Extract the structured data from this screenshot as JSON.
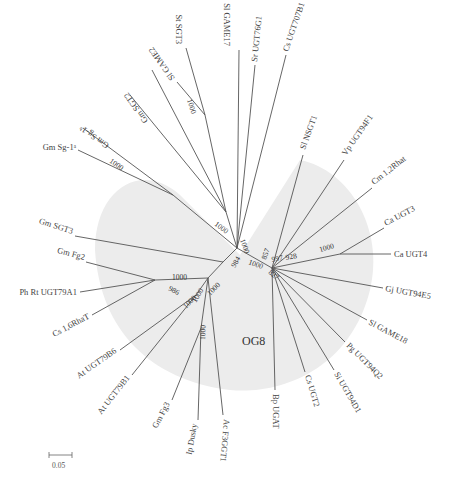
{
  "diagram": {
    "type": "unrooted phylogenetic tree",
    "group": {
      "label": "OG8",
      "shade_color": "#ececec"
    },
    "scale_bar": {
      "label": "0.05"
    },
    "leaves": [
      {
        "id": "sl_game2",
        "label": "Sl GAME2"
      },
      {
        "id": "st_sgt3",
        "label": "St SGT3"
      },
      {
        "id": "sl_game17",
        "label": "Sl GAME17"
      },
      {
        "id": "sr_ugt76g1",
        "label": "Sr UGT76G1"
      },
      {
        "id": "ca_ugt707b1",
        "label": "Cs UGT707B1"
      },
      {
        "id": "gm_sgt2",
        "label": "Gm SGT2"
      },
      {
        "id": "gm_sg1b",
        "label": "Gm Sg-1ᵇ"
      },
      {
        "id": "gm_sg1a",
        "label": "Gm Sg-1ᵃ"
      },
      {
        "id": "sl_nsgt1",
        "label": "Sl NSGT1"
      },
      {
        "id": "vp_ugt94f1",
        "label": "Vp UGT94F1"
      },
      {
        "id": "cm_12rhat",
        "label": "Cm 1,2Rhat"
      },
      {
        "id": "ca_ugt3",
        "label": "Ca UGT3"
      },
      {
        "id": "ca_ugt4",
        "label": "Ca UGT4"
      },
      {
        "id": "gj_ugt94e5",
        "label": "Gj UGT94E5"
      },
      {
        "id": "sl_game18",
        "label": "Sl GAME18"
      },
      {
        "id": "pg_ugt94q2",
        "label": "Pg UGT94Q2"
      },
      {
        "id": "si_ugt94d1",
        "label": "Si UGT94D1"
      },
      {
        "id": "cs_ugt2",
        "label": "Cs UGT2"
      },
      {
        "id": "bp_ugat",
        "label": "Bp UGAT"
      },
      {
        "id": "gm_sgt3",
        "label": "Gm SGT3"
      },
      {
        "id": "gm_fg2",
        "label": "Gm Fg2"
      },
      {
        "id": "ph_rt",
        "label": "Ph Rt UGT79A1"
      },
      {
        "id": "cs_16rhat",
        "label": "Cs 1,6RhaT"
      },
      {
        "id": "at_ugt79b6",
        "label": "At UGT79B6"
      },
      {
        "id": "at_ugt79b1",
        "label": "At UGT79B1"
      },
      {
        "id": "gm_fg3",
        "label": "Gm Fg3"
      },
      {
        "id": "ip_dusky",
        "label": "Ip Dusky"
      },
      {
        "id": "ac_f3ggt1",
        "label": "Ac F3GGT1"
      }
    ],
    "bootstrap_values": [
      {
        "id": "b_sgt3",
        "value": "1000"
      },
      {
        "id": "b_sg1",
        "value": "1000"
      },
      {
        "id": "b_sgt2",
        "value": "1000"
      },
      {
        "id": "b_top",
        "value": "1000"
      },
      {
        "id": "b_984",
        "value": "984"
      },
      {
        "id": "b_center",
        "value": "1000"
      },
      {
        "id": "b_827",
        "value": "827"
      },
      {
        "id": "b_857",
        "value": "857"
      },
      {
        "id": "b_997",
        "value": "997"
      },
      {
        "id": "b_928",
        "value": "928"
      },
      {
        "id": "b_ca",
        "value": "1000"
      },
      {
        "id": "b_fg2",
        "value": "1000"
      },
      {
        "id": "b_986",
        "value": "986"
      },
      {
        "id": "b_left1",
        "value": "1000"
      },
      {
        "id": "b_left2",
        "value": "1000"
      },
      {
        "id": "b_left3",
        "value": "1000"
      },
      {
        "id": "b_left4",
        "value": "1000"
      }
    ]
  }
}
